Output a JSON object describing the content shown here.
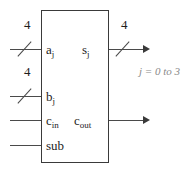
{
  "diagram": {
    "block": {
      "name": "adder-subtractor-block"
    },
    "ports": {
      "input_a": {
        "label": "a",
        "subscript": "j",
        "bus_width": "4"
      },
      "input_b": {
        "label": "b",
        "subscript": "j",
        "bus_width": "4"
      },
      "input_cin": {
        "label": "c",
        "subscript": "in"
      },
      "input_sub": {
        "label": "sub"
      },
      "output_s": {
        "label": "s",
        "subscript": "j",
        "bus_width": "4"
      },
      "output_cout": {
        "label": "c",
        "subscript": "out"
      }
    },
    "annotation": {
      "index_range": "j = 0 to 3"
    },
    "colors": {
      "box_border": "#3a3a3a",
      "wire": "#4a4a4a",
      "text": "#1d1d1d",
      "annotation": "#8a8a8a",
      "background": "#ffffff"
    }
  }
}
